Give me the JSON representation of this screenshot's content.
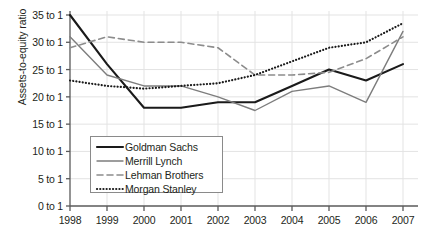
{
  "chart_data": {
    "type": "line",
    "title": "",
    "xlabel": "",
    "ylabel": "Assets-to-equity ratio",
    "x": [
      1998,
      1999,
      2000,
      2001,
      2002,
      2003,
      2004,
      2005,
      2006,
      2007
    ],
    "categories": [
      "1998",
      "1999",
      "2000",
      "2001",
      "2002",
      "2003",
      "2004",
      "2005",
      "2006",
      "2007"
    ],
    "ylim": [
      0,
      35
    ],
    "ytick_values": [
      0,
      5,
      10,
      15,
      20,
      25,
      30,
      35
    ],
    "ytick_labels": [
      "0 to 1",
      "5 to 1",
      "10 to 1",
      "15 to 1",
      "20 to 1",
      "25 to 1",
      "30 to 1",
      "35 to 1"
    ],
    "grid": true,
    "legend_position": "lower-left-inside",
    "series": [
      {
        "name": "Goldman Sachs",
        "style": "solid",
        "color": "#1a1a1a",
        "width": 2.1,
        "values": [
          35,
          26,
          18,
          18,
          19,
          19,
          22,
          25,
          23,
          26
        ]
      },
      {
        "name": "Merrill Lynch",
        "style": "solid",
        "color": "#7d7d7d",
        "width": 1.4,
        "values": [
          31,
          24,
          22,
          22,
          20,
          17.5,
          21,
          22,
          19,
          32
        ]
      },
      {
        "name": "Lehman Brothers",
        "style": "dashed",
        "color": "#8c8c8c",
        "width": 1.6,
        "values": [
          29,
          31,
          30,
          30,
          29,
          24,
          24,
          24.5,
          27,
          31
        ]
      },
      {
        "name": "Morgan Stanley",
        "style": "dotted",
        "color": "#1a1a1a",
        "width": 2.2,
        "values": [
          23,
          22,
          21.5,
          22,
          22.5,
          24,
          26.5,
          29,
          30,
          33.5
        ]
      }
    ]
  },
  "axes": {
    "y_title": "Assets-to-equity ratio"
  },
  "legend": {
    "items": [
      {
        "label": "Goldman Sachs"
      },
      {
        "label": "Merrill Lynch"
      },
      {
        "label": "Lehman Brothers"
      },
      {
        "label": "Morgan Stanley"
      }
    ]
  },
  "colors": {
    "axis": "#5a5a5a",
    "grid": "#e3e3e3",
    "text": "#231f20",
    "legend_border": "#8a8a8a"
  }
}
